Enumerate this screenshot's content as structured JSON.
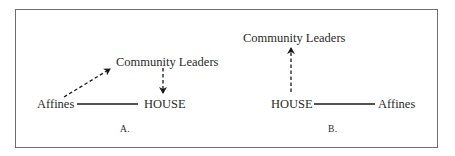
{
  "diagram": {
    "panel_a": {
      "caption": "A.",
      "nodes": {
        "affines": "Affines",
        "house": "HOUSE",
        "community_leaders": "Community Leaders"
      },
      "edges": [
        {
          "from": "Affines",
          "to": "HOUSE",
          "style": "solid",
          "directed": false
        },
        {
          "from": "Affines",
          "to": "Community Leaders",
          "style": "dashed",
          "directed": true
        },
        {
          "from": "Community Leaders",
          "to": "HOUSE",
          "style": "dashed",
          "directed": true
        }
      ]
    },
    "panel_b": {
      "caption": "B.",
      "nodes": {
        "community_leaders": "Community Leaders",
        "house": "HOUSE",
        "affines": "Affines"
      },
      "edges": [
        {
          "from": "HOUSE",
          "to": "Affines",
          "style": "solid",
          "directed": false
        },
        {
          "from": "HOUSE",
          "to": "Community Leaders",
          "style": "dashed",
          "directed": true
        }
      ]
    },
    "colors": {
      "border": "#6e6e6e",
      "text": "#2a2a2a",
      "line": "#1a1a1a"
    }
  }
}
